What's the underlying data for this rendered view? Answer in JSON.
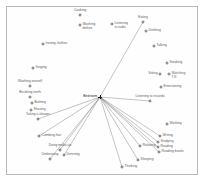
{
  "figure": {
    "type": "scatter-network",
    "background_color": "#ffffff",
    "frame_color": "#b9b9b9",
    "marker_color": "#6e6e6e",
    "edge_color": "#7a7a7a",
    "hub_color": "#1a1a1a",
    "label_color": "#5a5a5a"
  },
  "chart_data": {
    "type": "scatter",
    "title": "",
    "subtitle": "",
    "xlabel": "",
    "ylabel": "",
    "grid": false,
    "legend": "none",
    "axis_ticks": "none",
    "hub": {
      "label": "Bedroom",
      "x": 100,
      "y": 97,
      "label_anchor": "left"
    },
    "points": [
      {
        "label": "Cooking",
        "x": 80,
        "y": 15,
        "anchor": "top"
      },
      {
        "label": "Washing\ndishes",
        "x": 80,
        "y": 25,
        "anchor": "right"
      },
      {
        "label": "Ironing clothes",
        "x": 43,
        "y": 44,
        "anchor": "right"
      },
      {
        "label": "Singing",
        "x": 33,
        "y": 68,
        "anchor": "right"
      },
      {
        "label": "Washing oneself",
        "x": 30,
        "y": 86,
        "anchor": "top"
      },
      {
        "label": "Brushing teeth",
        "x": 30,
        "y": 97,
        "anchor": "top"
      },
      {
        "label": "Bathing",
        "x": 32,
        "y": 103,
        "anchor": "right"
      },
      {
        "label": "Shaving",
        "x": 31,
        "y": 110,
        "anchor": "right"
      },
      {
        "label": "Taking a shower",
        "x": 38,
        "y": 119,
        "anchor": "top"
      },
      {
        "label": "Combing hair",
        "x": 39,
        "y": 136,
        "anchor": "right"
      },
      {
        "label": "Doing make-up",
        "x": 60,
        "y": 150,
        "anchor": "top"
      },
      {
        "label": "Dressing",
        "x": 64,
        "y": 155,
        "anchor": "right"
      },
      {
        "label": "Undressing",
        "x": 50,
        "y": 159,
        "anchor": "top"
      },
      {
        "label": "Thinking",
        "x": 122,
        "y": 167,
        "anchor": "right"
      },
      {
        "label": "Sleeping",
        "x": 138,
        "y": 160,
        "anchor": "right"
      },
      {
        "label": "Relaxing",
        "x": 140,
        "y": 146,
        "anchor": "right"
      },
      {
        "label": "Reading books",
        "x": 159,
        "y": 152,
        "anchor": "right"
      },
      {
        "label": "Reading",
        "x": 158,
        "y": 147,
        "anchor": "right"
      },
      {
        "label": "Studying",
        "x": 158,
        "y": 142,
        "anchor": "right"
      },
      {
        "label": "Writing",
        "x": 160,
        "y": 136,
        "anchor": "right"
      },
      {
        "label": "Working",
        "x": 167,
        "y": 124,
        "anchor": "right"
      },
      {
        "label": "Listening to records",
        "x": 150,
        "y": 101,
        "anchor": "top"
      },
      {
        "label": "Entertaining",
        "x": 161,
        "y": 87,
        "anchor": "right"
      },
      {
        "label": "Watching\nT.V.",
        "x": 169,
        "y": 74,
        "anchor": "right"
      },
      {
        "label": "Sitting",
        "x": 160,
        "y": 74,
        "anchor": "left"
      },
      {
        "label": "Smoking",
        "x": 167,
        "y": 63,
        "anchor": "right"
      },
      {
        "label": "Talking",
        "x": 154,
        "y": 46,
        "anchor": "right"
      },
      {
        "label": "Drinking",
        "x": 146,
        "y": 31,
        "anchor": "right"
      },
      {
        "label": "Eating",
        "x": 143,
        "y": 22,
        "anchor": "top"
      },
      {
        "label": "Listening\nto radio",
        "x": 112,
        "y": 24,
        "anchor": "right"
      }
    ],
    "edges": [
      {
        "from": "Bedroom",
        "to": "Listening to radio"
      },
      {
        "from": "Bedroom",
        "to": "Eating"
      },
      {
        "from": "Bedroom",
        "to": "Listening to records"
      },
      {
        "from": "Bedroom",
        "to": "Relaxing"
      },
      {
        "from": "Bedroom",
        "to": "Sleeping"
      },
      {
        "from": "Bedroom",
        "to": "Thinking"
      },
      {
        "from": "Bedroom",
        "to": "Reading books"
      },
      {
        "from": "Bedroom",
        "to": "Reading"
      },
      {
        "from": "Bedroom",
        "to": "Studying"
      },
      {
        "from": "Bedroom",
        "to": "Writing"
      },
      {
        "from": "Bedroom",
        "to": "Doing make-up"
      },
      {
        "from": "Bedroom",
        "to": "Dressing"
      },
      {
        "from": "Bedroom",
        "to": "Undressing"
      },
      {
        "from": "Bedroom",
        "to": "Combing hair"
      },
      {
        "from": "Bedroom",
        "to": "Taking a shower"
      }
    ]
  }
}
